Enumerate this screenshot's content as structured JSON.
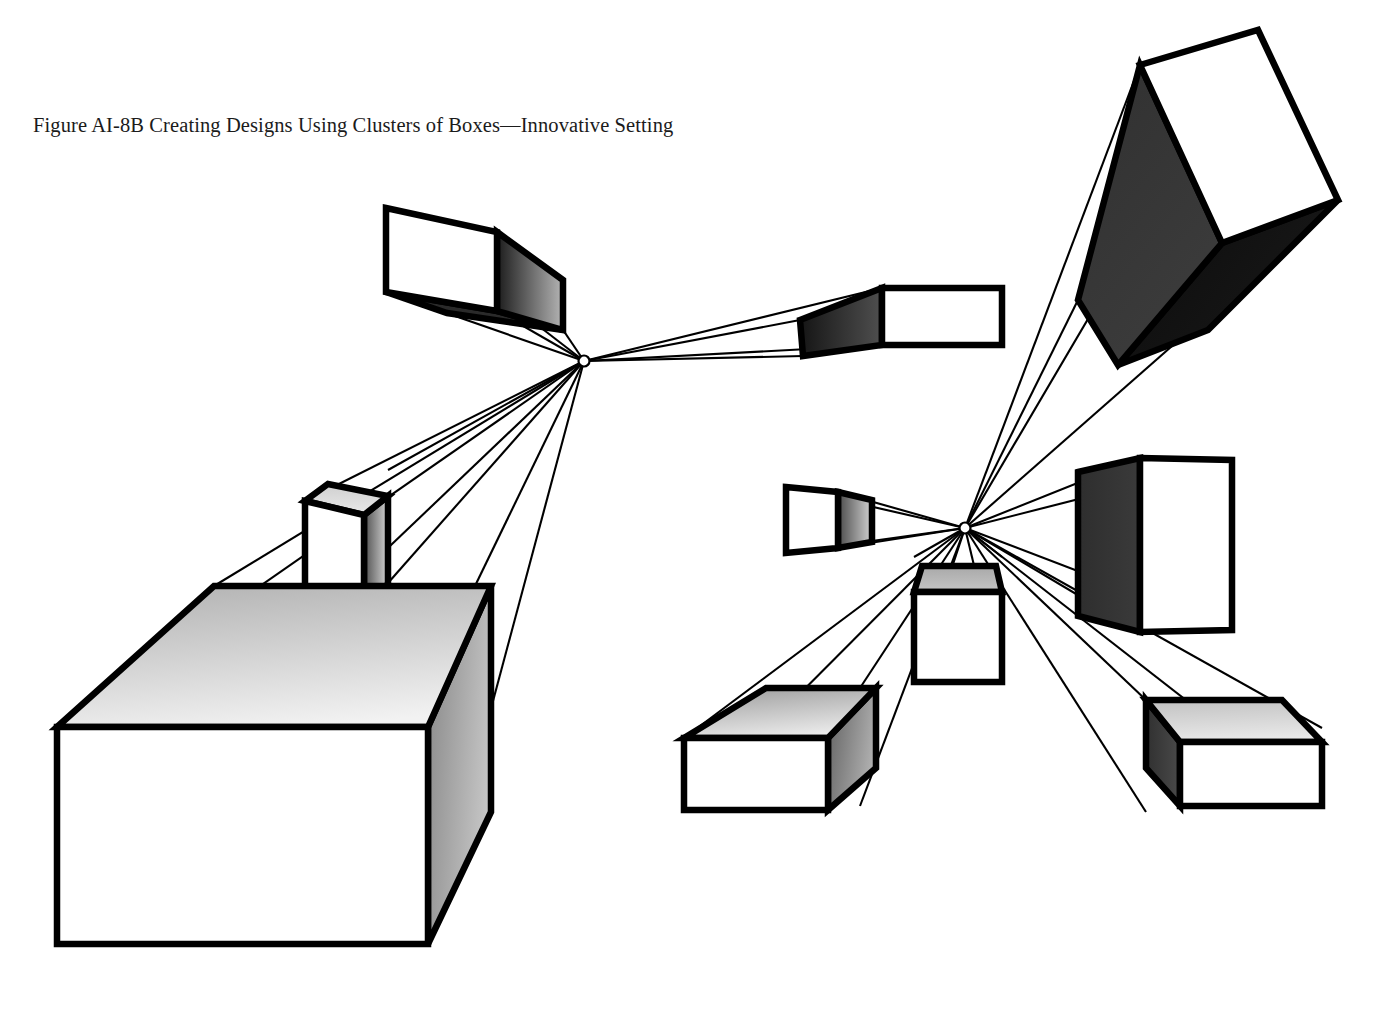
{
  "figure": {
    "caption": "Figure AI-8B Creating Designs Using Clusters of Boxes—Innovative Setting",
    "background_color": "#ffffff",
    "line_color": "#000000",
    "canvas": {
      "width": 1374,
      "height": 1012
    }
  },
  "palette": {
    "stroke": "#000000",
    "white_face": "#ffffff",
    "light_gray": "#d8d8d8",
    "mid_gray": "#9a9a9a",
    "dark_gray": "#4a4a4a",
    "near_black": "#1c1c1c",
    "black_face": "#000000"
  },
  "vanishing_points": [
    {
      "name": "left-vanishing-point",
      "label": "VP-left",
      "x": 584,
      "y": 361,
      "radius": 5.5
    },
    {
      "name": "right-vanishing-point",
      "label": "VP-right",
      "x": 965,
      "y": 528,
      "radius": 5.5
    }
  ],
  "convergence_lines": {
    "left_cluster": [
      [
        584,
        361,
        386,
        208
      ],
      [
        584,
        361,
        386,
        292
      ],
      [
        584,
        361,
        497,
        311
      ],
      [
        584,
        361,
        497,
        232
      ],
      [
        584,
        361,
        882,
        288
      ],
      [
        584,
        361,
        882,
        345
      ],
      [
        584,
        361,
        800,
        320
      ],
      [
        584,
        361,
        803,
        356
      ],
      [
        584,
        361,
        305,
        501
      ],
      [
        584,
        361,
        388,
        470
      ],
      [
        584,
        361,
        388,
        583
      ],
      [
        584,
        361,
        305,
        627
      ],
      [
        584,
        361,
        57,
        727
      ],
      [
        584,
        361,
        214,
        586
      ],
      [
        584,
        361,
        428,
        683
      ],
      [
        584,
        361,
        428,
        944
      ]
    ],
    "right_cluster": [
      [
        965,
        528,
        1140,
        65
      ],
      [
        965,
        528,
        1338,
        200
      ],
      [
        965,
        528,
        1078,
        300
      ],
      [
        965,
        528,
        1258,
        30
      ],
      [
        965,
        528,
        786,
        487
      ],
      [
        965,
        528,
        786,
        553
      ],
      [
        965,
        528,
        838,
        492
      ],
      [
        965,
        528,
        838,
        548
      ],
      [
        965,
        528,
        1140,
        458
      ],
      [
        965,
        528,
        1140,
        632
      ],
      [
        965,
        528,
        1232,
        460
      ],
      [
        965,
        528,
        1232,
        630
      ],
      [
        965,
        528,
        914,
        557
      ],
      [
        965,
        528,
        1002,
        557
      ],
      [
        965,
        528,
        914,
        682
      ],
      [
        965,
        528,
        1002,
        682
      ],
      [
        965,
        528,
        684,
        738
      ],
      [
        965,
        528,
        684,
        810
      ],
      [
        965,
        528,
        860,
        688
      ],
      [
        965,
        528,
        860,
        806
      ],
      [
        965,
        528,
        1146,
        700
      ],
      [
        965,
        528,
        1146,
        812
      ],
      [
        965,
        528,
        1322,
        728
      ],
      [
        965,
        528,
        1322,
        806
      ]
    ]
  },
  "boxes": [
    {
      "name": "box-upper-left-cube",
      "cluster": "left",
      "front_face": [
        [
          386,
          208
        ],
        [
          497,
          232
        ],
        [
          497,
          311
        ],
        [
          386,
          292
        ]
      ],
      "side_face": [
        [
          497,
          232
        ],
        [
          563,
          280
        ],
        [
          563,
          330
        ],
        [
          497,
          311
        ]
      ],
      "bottom_face": [
        [
          386,
          292
        ],
        [
          497,
          311
        ],
        [
          563,
          330
        ],
        [
          447,
          313
        ]
      ],
      "side_shade": {
        "from": "#1c1c1c",
        "to": "#b5b5b5",
        "angle": 0
      },
      "bottom_shade": {
        "from": "#2a2a2a",
        "to": "#2a2a2a",
        "angle": 0
      }
    },
    {
      "name": "box-right-of-left-vp",
      "cluster": "left",
      "front_face": [
        [
          882,
          288
        ],
        [
          1002,
          288
        ],
        [
          1002,
          345
        ],
        [
          882,
          345
        ]
      ],
      "side_face": [
        [
          800,
          320
        ],
        [
          882,
          288
        ],
        [
          882,
          345
        ],
        [
          803,
          356
        ]
      ],
      "side_shade": {
        "from": "#151515",
        "to": "#4f4f4f",
        "angle": 0
      }
    },
    {
      "name": "box-tall-column",
      "cluster": "left",
      "front_face": [
        [
          305,
          501
        ],
        [
          364,
          515
        ],
        [
          364,
          627
        ],
        [
          305,
          617
        ]
      ],
      "top_face": [
        [
          305,
          501
        ],
        [
          364,
          515
        ],
        [
          388,
          496
        ],
        [
          328,
          484
        ]
      ],
      "side_face": [
        [
          364,
          515
        ],
        [
          388,
          496
        ],
        [
          388,
          583
        ],
        [
          364,
          627
        ]
      ],
      "side_shade": {
        "from": "#4e4e4e",
        "to": "#d5d5d5",
        "angle": 0
      },
      "top_shade": {
        "from": "#cfcfcf",
        "to": "#eaeaea",
        "angle": 90
      }
    },
    {
      "name": "box-large-foreground-slab",
      "cluster": "left",
      "front_face": [
        [
          57,
          727
        ],
        [
          428,
          727
        ],
        [
          428,
          944
        ],
        [
          57,
          944
        ]
      ],
      "top_face": [
        [
          57,
          727
        ],
        [
          214,
          586
        ],
        [
          491,
          586
        ],
        [
          428,
          727
        ]
      ],
      "side_face": [
        [
          428,
          727
        ],
        [
          491,
          586
        ],
        [
          491,
          812
        ],
        [
          428,
          944
        ]
      ],
      "top_shade": {
        "from": "#b7b7b7",
        "to": "#f2f2f2",
        "angle": 75
      },
      "side_shade": {
        "from": "#8f8f8f",
        "to": "#c8c8c8",
        "angle": 20
      }
    },
    {
      "name": "box-large-tilted-cube",
      "cluster": "right",
      "front_face": [
        [
          1140,
          65
        ],
        [
          1258,
          30
        ],
        [
          1338,
          200
        ],
        [
          1222,
          243
        ]
      ],
      "side_face": [
        [
          1140,
          65
        ],
        [
          1222,
          243
        ],
        [
          1118,
          365
        ],
        [
          1078,
          300
        ]
      ],
      "bottom_face": [
        [
          1222,
          243
        ],
        [
          1338,
          200
        ],
        [
          1208,
          330
        ],
        [
          1118,
          365
        ]
      ],
      "side_shade": {
        "from": "#323232",
        "to": "#3c3c3c",
        "angle": 60
      },
      "bottom_shade": {
        "from": "#0d0d0d",
        "to": "#191919",
        "angle": 30
      }
    },
    {
      "name": "box-small-left-of-right-vp",
      "cluster": "right",
      "front_face": [
        [
          786,
          487
        ],
        [
          838,
          492
        ],
        [
          838,
          548
        ],
        [
          786,
          553
        ]
      ],
      "side_face": [
        [
          838,
          492
        ],
        [
          872,
          500
        ],
        [
          872,
          542
        ],
        [
          838,
          548
        ]
      ],
      "side_shade": {
        "from": "#4a4a4a",
        "to": "#d2d2d2",
        "angle": 0
      }
    },
    {
      "name": "box-tall-right-upright",
      "cluster": "right",
      "front_face": [
        [
          1140,
          458
        ],
        [
          1232,
          460
        ],
        [
          1232,
          630
        ],
        [
          1140,
          632
        ]
      ],
      "side_face": [
        [
          1078,
          472
        ],
        [
          1140,
          458
        ],
        [
          1140,
          632
        ],
        [
          1078,
          616
        ]
      ],
      "side_shade": {
        "from": "#2e2e2e",
        "to": "#3a3a3a",
        "angle": 0
      }
    },
    {
      "name": "box-center-cube",
      "cluster": "right",
      "front_face": [
        [
          914,
          592
        ],
        [
          1002,
          592
        ],
        [
          1002,
          682
        ],
        [
          914,
          682
        ]
      ],
      "top_face": [
        [
          914,
          592
        ],
        [
          1002,
          592
        ],
        [
          996,
          566
        ],
        [
          922,
          566
        ]
      ],
      "top_shade": {
        "from": "#a8a8a8",
        "to": "#c6c6c6",
        "angle": 90
      }
    },
    {
      "name": "box-lower-left-of-right-cluster",
      "cluster": "right",
      "front_face": [
        [
          684,
          738
        ],
        [
          828,
          738
        ],
        [
          828,
          810
        ],
        [
          684,
          810
        ]
      ],
      "top_face": [
        [
          684,
          738
        ],
        [
          766,
          688
        ],
        [
          876,
          688
        ],
        [
          828,
          738
        ]
      ],
      "side_face": [
        [
          828,
          738
        ],
        [
          876,
          688
        ],
        [
          876,
          768
        ],
        [
          828,
          810
        ]
      ],
      "top_shade": {
        "from": "#a4a4a4",
        "to": "#ededed",
        "angle": 70
      },
      "side_shade": {
        "from": "#6a6a6a",
        "to": "#b4b4b4",
        "angle": 20
      }
    },
    {
      "name": "box-lower-right-of-right-cluster",
      "cluster": "right",
      "front_face": [
        [
          1180,
          742
        ],
        [
          1322,
          742
        ],
        [
          1322,
          806
        ],
        [
          1180,
          806
        ]
      ],
      "top_face": [
        [
          1180,
          742
        ],
        [
          1146,
          700
        ],
        [
          1282,
          700
        ],
        [
          1322,
          742
        ]
      ],
      "side_face": [
        [
          1180,
          742
        ],
        [
          1146,
          700
        ],
        [
          1146,
          768
        ],
        [
          1180,
          806
        ]
      ],
      "top_shade": {
        "from": "#c4c4c4",
        "to": "#ebebeb",
        "angle": 80
      },
      "side_shade": {
        "from": "#303030",
        "to": "#4a4a4a",
        "angle": 0
      }
    }
  ]
}
